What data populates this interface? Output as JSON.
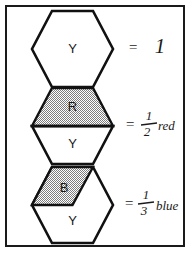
{
  "figure": {
    "background_color": "#ffffff",
    "border_color": "#1a1a1a",
    "ink_color": "#1a1a1a",
    "shade_color": "#8a8a8a",
    "rows": [
      {
        "id": "row-whole",
        "shape_name": "hexagon",
        "fill_style": "plain",
        "letters": [
          {
            "text": "Y",
            "region": "whole"
          }
        ],
        "equals": "=",
        "value_kind": "whole",
        "value_text": "1",
        "numerator": "",
        "denominator": "",
        "color_word": ""
      },
      {
        "id": "row-half-red",
        "shape_name": "hexagon",
        "fill_style": "half-shaded-top",
        "letters": [
          {
            "text": "R",
            "region": "top-half"
          },
          {
            "text": "Y",
            "region": "bottom-half"
          }
        ],
        "equals": "=",
        "value_kind": "fraction",
        "value_text": "1/2",
        "numerator": "1",
        "denominator": "2",
        "color_word": "red"
      },
      {
        "id": "row-third-blue",
        "shape_name": "hexagon",
        "fill_style": "third-shaded-upper-left-rhombus",
        "letters": [
          {
            "text": "B",
            "region": "upper-left-third"
          },
          {
            "text": "Y",
            "region": "remaining"
          }
        ],
        "equals": "=",
        "value_kind": "fraction",
        "value_text": "1/3",
        "numerator": "1",
        "denominator": "3",
        "color_word": "blue"
      }
    ]
  }
}
